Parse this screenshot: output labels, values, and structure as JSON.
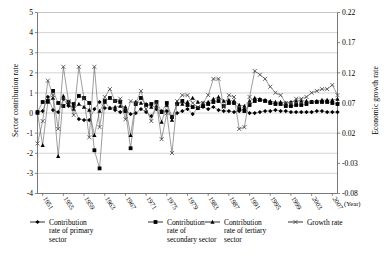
{
  "chart_data": {
    "type": "line",
    "title": "",
    "xlabel": "(Year)",
    "ylabel": "Sector contribution rate",
    "ylabel_secondary": "Economic growth rate",
    "ylim": [
      -4,
      5
    ],
    "ylim_secondary": [
      -0.08,
      0.22
    ],
    "yticks": [
      "5",
      "4",
      "3",
      "2",
      "1",
      "0",
      "-1",
      "-2",
      "-3",
      "-4"
    ],
    "ytick_values": [
      5,
      4,
      3,
      2,
      1,
      0,
      -1,
      -2,
      -3,
      -4
    ],
    "yticks_secondary": [
      "0.22",
      "0.17",
      "0.12",
      "0.07",
      "0.02",
      "-0.03",
      "-0.08"
    ],
    "ytick_values_secondary": [
      0.22,
      0.17,
      0.12,
      0.07,
      0.02,
      -0.03,
      -0.08
    ],
    "xticks": [
      "1951",
      "1955",
      "1959",
      "1963",
      "1967",
      "1971",
      "1975",
      "1979",
      "1983",
      "1987",
      "1991",
      "1995",
      "1999",
      "2003",
      "2007"
    ],
    "xlim": [
      1950,
      2008
    ],
    "grid": true,
    "legend_position": "bottom",
    "x": [
      1950,
      1951,
      1952,
      1953,
      1954,
      1955,
      1956,
      1957,
      1958,
      1959,
      1960,
      1961,
      1962,
      1963,
      1964,
      1965,
      1966,
      1967,
      1968,
      1969,
      1970,
      1971,
      1972,
      1973,
      1974,
      1975,
      1976,
      1977,
      1978,
      1979,
      1980,
      1981,
      1982,
      1983,
      1984,
      1985,
      1986,
      1987,
      1988,
      1989,
      1990,
      1991,
      1992,
      1993,
      1994,
      1995,
      1996,
      1997,
      1998,
      1999,
      2000,
      2001,
      2002,
      2003,
      2004,
      2005,
      2006,
      2007,
      2008
    ],
    "series": [
      {
        "name": "Contribution rate of primary sector",
        "marker": "diamond",
        "axis": "left",
        "values": [
          0.05,
          0.1,
          0.8,
          0.15,
          0.05,
          0.7,
          0.35,
          0.3,
          -0.3,
          -0.35,
          -0.35,
          0.2,
          0.55,
          0.25,
          0.25,
          0.15,
          0.05,
          0.15,
          -0.05,
          0.0,
          0.2,
          0.05,
          -0.15,
          0.2,
          0.1,
          0.1,
          -0.2,
          0.0,
          0.1,
          0.2,
          -0.05,
          0.25,
          0.3,
          0.2,
          0.3,
          0.15,
          0.1,
          0.1,
          0.05,
          0.1,
          0.2,
          0.0,
          0.0,
          0.05,
          0.1,
          0.1,
          0.15,
          0.1,
          0.1,
          0.05,
          0.05,
          0.05,
          0.05,
          0.05,
          0.1,
          0.1,
          0.05,
          0.05,
          0.05
        ]
      },
      {
        "name": "Contribution rate of secondary sector",
        "marker": "square",
        "axis": "left",
        "values": [
          0.05,
          0.55,
          0.6,
          1.1,
          0.5,
          0.35,
          0.55,
          0.45,
          0.85,
          0.75,
          0.5,
          -1.85,
          -2.75,
          0.6,
          0.75,
          0.6,
          0.55,
          0.1,
          -1.75,
          0.45,
          0.75,
          0.4,
          0.45,
          0.55,
          0.05,
          0.5,
          -0.2,
          0.45,
          0.6,
          0.4,
          0.3,
          0.25,
          0.35,
          0.45,
          0.55,
          0.6,
          0.35,
          0.5,
          0.5,
          0.2,
          0.1,
          0.4,
          0.6,
          0.65,
          0.6,
          0.5,
          0.45,
          0.45,
          0.35,
          0.35,
          0.4,
          0.4,
          0.45,
          0.55,
          0.55,
          0.55,
          0.55,
          0.5,
          0.45
        ]
      },
      {
        "name": "Contribution rate of tertiary sector",
        "marker": "triangle",
        "axis": "left",
        "values": [
          0.0,
          -1.6,
          0.55,
          0.75,
          -2.15,
          0.85,
          0.45,
          0.2,
          0.45,
          0.3,
          0.15,
          -1.1,
          0.1,
          0.55,
          0.25,
          0.3,
          0.35,
          0.3,
          -1.1,
          0.55,
          0.5,
          0.45,
          0.3,
          0.35,
          -0.45,
          0.4,
          -0.35,
          0.55,
          0.45,
          0.55,
          0.75,
          0.55,
          0.5,
          0.55,
          0.7,
          0.8,
          0.6,
          0.65,
          0.6,
          0.4,
          0.35,
          0.6,
          0.75,
          0.7,
          0.65,
          0.6,
          0.55,
          0.55,
          0.5,
          0.55,
          0.6,
          0.6,
          0.6,
          0.55,
          0.6,
          0.65,
          0.65,
          0.65,
          0.7
        ]
      },
      {
        "name": "Growth rate",
        "marker": "cross",
        "axis": "right",
        "values": [
          0.003,
          0.04,
          0.107,
          0.083,
          0.027,
          0.13,
          0.073,
          0.05,
          0.13,
          0.077,
          0.013,
          0.13,
          0.03,
          0.08,
          0.093,
          0.073,
          0.077,
          0.043,
          0.073,
          0.07,
          0.09,
          0.06,
          0.04,
          0.07,
          0.01,
          0.053,
          -0.013,
          0.073,
          0.083,
          0.083,
          0.07,
          0.063,
          0.07,
          0.083,
          0.11,
          0.11,
          0.063,
          0.083,
          0.08,
          0.027,
          0.03,
          0.08,
          0.123,
          0.117,
          0.11,
          0.097,
          0.087,
          0.083,
          0.07,
          0.07,
          0.077,
          0.077,
          0.08,
          0.087,
          0.09,
          0.093,
          0.093,
          0.1,
          0.083
        ]
      }
    ]
  },
  "legend": {
    "items": [
      {
        "label": "Contribution rate of primary sector",
        "marker": "diamond-marker-icon"
      },
      {
        "label": "Contribution rate of secondary sector",
        "marker": "square-marker-icon"
      },
      {
        "label": "Contribution rate of tertiary sector",
        "marker": "triangle-marker-icon"
      },
      {
        "label": "Growth rate",
        "marker": "cross-marker-icon"
      }
    ]
  }
}
